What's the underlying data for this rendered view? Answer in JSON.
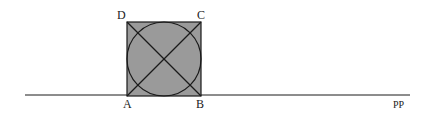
{
  "diagram": {
    "title": "",
    "labels": {
      "A": "A",
      "B": "B",
      "C": "C",
      "D": "D",
      "line": "PP"
    },
    "colors": {
      "square_fill": "#9a9a9a",
      "stroke": "#1a1a1a",
      "background": "#ffffff"
    },
    "shapes": {
      "square": {
        "x": 127,
        "y": 22,
        "size": 74
      },
      "inscribed_circle": {
        "cx": 164,
        "cy": 59,
        "r": 37
      },
      "diagonals": [
        "AC",
        "BD"
      ],
      "ground_line": {
        "x1": 25,
        "x2": 410,
        "y": 95
      }
    }
  }
}
